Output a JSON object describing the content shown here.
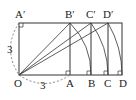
{
  "diagram": {
    "type": "geometry",
    "side_label": "3",
    "left_side_label": "3",
    "points": {
      "O": {
        "label": "O",
        "x": 19,
        "y": 75
      },
      "A": {
        "label": "A",
        "x": 70,
        "y": 75
      },
      "B": {
        "label": "B",
        "x": 91,
        "y": 75
      },
      "C": {
        "label": "C",
        "x": 108,
        "y": 75
      },
      "D": {
        "label": "D",
        "x": 122,
        "y": 75
      },
      "A_prime": {
        "label": "A′",
        "x": 19,
        "y": 23
      },
      "B_prime": {
        "label": "B′",
        "x": 70,
        "y": 23
      },
      "C_prime": {
        "label": "C′",
        "x": 91,
        "y": 23
      },
      "D_prime": {
        "label": "D′",
        "x": 108,
        "y": 23
      }
    },
    "colors": {
      "line": "#333333",
      "dashed": "#666666",
      "background": "#ffffff"
    }
  }
}
